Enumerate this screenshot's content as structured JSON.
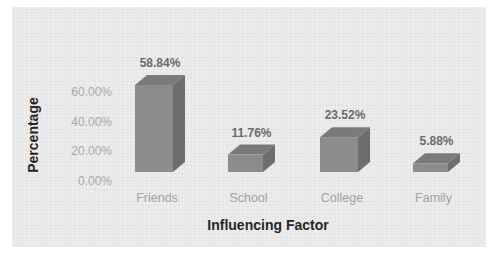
{
  "chart_data": {
    "type": "bar",
    "style": "3d-column",
    "title": "",
    "xlabel": "Influencing Factor",
    "ylabel": "Percentage",
    "categories": [
      "Friends",
      "School",
      "College",
      "Family"
    ],
    "values": [
      58.84,
      11.76,
      23.52,
      5.88
    ],
    "value_labels": [
      "58.84%",
      "11.76%",
      "23.52%",
      "5.88%"
    ],
    "yticks": [
      "0.00%",
      "20.00%",
      "40.00%",
      "60.00%"
    ],
    "ylim": [
      0,
      60
    ],
    "grid": false,
    "legend": null,
    "colors": {
      "bar_front": "#8c8c8c",
      "bar_top": "#7a7a7a",
      "bar_side": "#6e6e6e",
      "background": "#e9e9e9"
    }
  }
}
